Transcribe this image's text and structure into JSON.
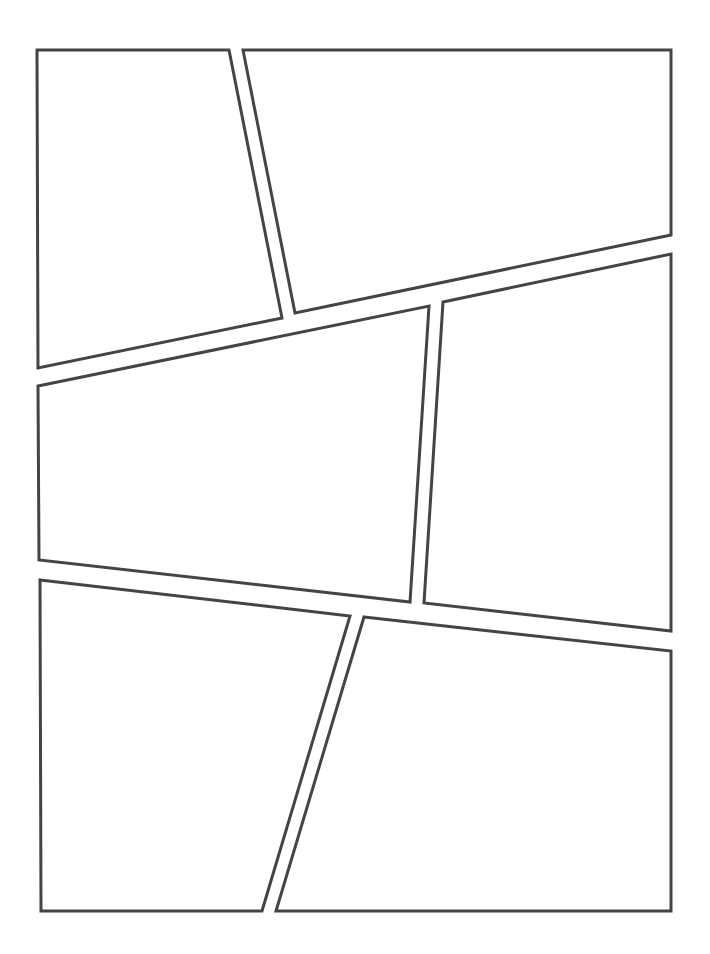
{
  "page": {
    "width": 710,
    "height": 954,
    "background": "#ffffff",
    "stroke_color": "#444444",
    "stroke_width": 3
  },
  "panels": [
    {
      "id": "panel-1",
      "points": "37,50 229,50 282,318 38,368"
    },
    {
      "id": "panel-2",
      "points": "243,50 671,50 671,235 295,313"
    },
    {
      "id": "panel-3",
      "points": "38,386 429,306 410,602 39,560"
    },
    {
      "id": "panel-4",
      "points": "443,302 671,254 671,631 424,603"
    },
    {
      "id": "panel-5",
      "points": "40,580 350,616 262,911 41,911"
    },
    {
      "id": "panel-6",
      "points": "364,617 671,651 671,911 276,911"
    }
  ]
}
